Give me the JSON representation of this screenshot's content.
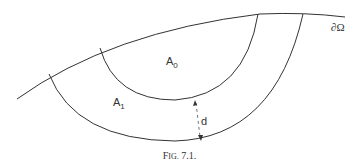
{
  "figure": {
    "boundary_label": "∂Ω",
    "region_inner": {
      "base": "A",
      "sub": "0"
    },
    "region_outer": {
      "base": "A",
      "sub": "1"
    },
    "distance_label": "d",
    "caption_prefix_F": "F",
    "caption_prefix_rest": "IG.",
    "caption_number": " 7.1."
  }
}
